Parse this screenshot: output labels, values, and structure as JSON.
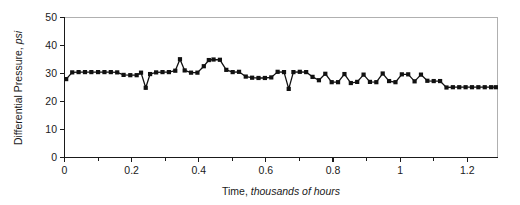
{
  "chart_data": {
    "type": "line",
    "title": "",
    "xlabel": "Time, thousands of hours",
    "xlabel_plain": "Time, ",
    "xlabel_emphasis": "thousands of hours",
    "ylabel": "Differential Pressure, psi",
    "ylabel_plain": "Differential Pressure, ",
    "ylabel_emphasis": "psi",
    "xlim": [
      0,
      1.29
    ],
    "ylim": [
      0,
      50
    ],
    "xticks": [
      0,
      0.2,
      0.4,
      0.6,
      0.8,
      1,
      1.2
    ],
    "xtick_labels": [
      "0",
      "0.2",
      "0.4",
      "0.6",
      "0.8",
      "1",
      "1.2"
    ],
    "xticks_minor": [
      0.1,
      0.3,
      0.5,
      0.7,
      0.9,
      1.1
    ],
    "yticks": [
      0,
      10,
      20,
      30,
      40,
      50
    ],
    "ytick_labels": [
      "0",
      "10",
      "20",
      "30",
      "40",
      "50"
    ],
    "grid": false,
    "legend": null,
    "marker": "square",
    "marker_color": "#111111",
    "line_color": "#111111",
    "frame_color": "#b0b0b0",
    "axis_color": "#1a1a1a",
    "series": [
      {
        "name": "Differential Pressure",
        "x": [
          0.005,
          0.023,
          0.042,
          0.061,
          0.08,
          0.1,
          0.119,
          0.138,
          0.157,
          0.176,
          0.196,
          0.215,
          0.228,
          0.242,
          0.255,
          0.273,
          0.292,
          0.311,
          0.33,
          0.344,
          0.358,
          0.377,
          0.396,
          0.415,
          0.43,
          0.444,
          0.463,
          0.482,
          0.501,
          0.52,
          0.54,
          0.559,
          0.578,
          0.597,
          0.616,
          0.635,
          0.654,
          0.668,
          0.682,
          0.701,
          0.72,
          0.739,
          0.758,
          0.777,
          0.796,
          0.815,
          0.834,
          0.853,
          0.872,
          0.891,
          0.91,
          0.929,
          0.948,
          0.967,
          0.986,
          1.005,
          1.024,
          1.043,
          1.062,
          1.081,
          1.1,
          1.119,
          1.138,
          1.157,
          1.176,
          1.195,
          1.214,
          1.233,
          1.252,
          1.271,
          1.285
        ],
        "y": [
          28.0,
          30.4,
          30.5,
          30.5,
          30.5,
          30.5,
          30.5,
          30.5,
          30.4,
          29.5,
          29.4,
          29.4,
          30.3,
          24.9,
          29.8,
          30.4,
          30.5,
          30.5,
          31.0,
          35.1,
          31.1,
          30.3,
          30.3,
          32.6,
          34.8,
          35.0,
          34.9,
          31.3,
          30.5,
          30.6,
          28.9,
          28.5,
          28.4,
          28.4,
          28.6,
          30.6,
          30.5,
          24.5,
          30.5,
          30.6,
          30.5,
          28.8,
          27.6,
          29.9,
          26.9,
          26.9,
          29.8,
          26.6,
          27.0,
          29.6,
          27.0,
          26.9,
          30.0,
          27.3,
          26.9,
          29.7,
          29.7,
          27.2,
          29.6,
          27.4,
          27.3,
          27.3,
          25.0,
          25.1,
          25.1,
          25.1,
          25.1,
          25.1,
          25.1,
          25.1,
          25.1
        ]
      }
    ]
  }
}
